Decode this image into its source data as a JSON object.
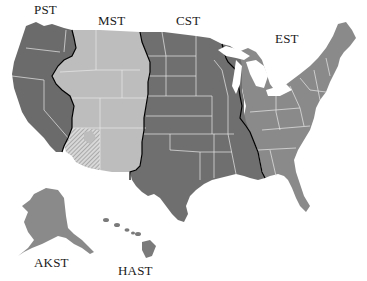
{
  "map": {
    "title": "US Time Zones",
    "zones": [
      {
        "id": "pst",
        "label": "PST",
        "color": "#6b6b6b",
        "label_x": 6,
        "label_y": 3
      },
      {
        "id": "mst",
        "label": "MST",
        "color": "#bdbdbd",
        "label_x": 98,
        "label_y": 14
      },
      {
        "id": "cst",
        "label": "CST",
        "color": "#6f6f6f",
        "label_x": 176,
        "label_y": 14
      },
      {
        "id": "est",
        "label": "EST",
        "color": "#8a8a8a",
        "label_x": 275,
        "label_y": 32
      },
      {
        "id": "akst",
        "label": "AKST",
        "color": "#8a8a8a",
        "label_x": 34,
        "label_y": 256
      },
      {
        "id": "hast",
        "label": "HAST",
        "color": "#7a7a7a",
        "label_x": 118,
        "label_y": 264
      }
    ],
    "arizona_pattern": "hatched",
    "boundary_color": "#000000",
    "state_border_color": "#e8e8e8"
  }
}
